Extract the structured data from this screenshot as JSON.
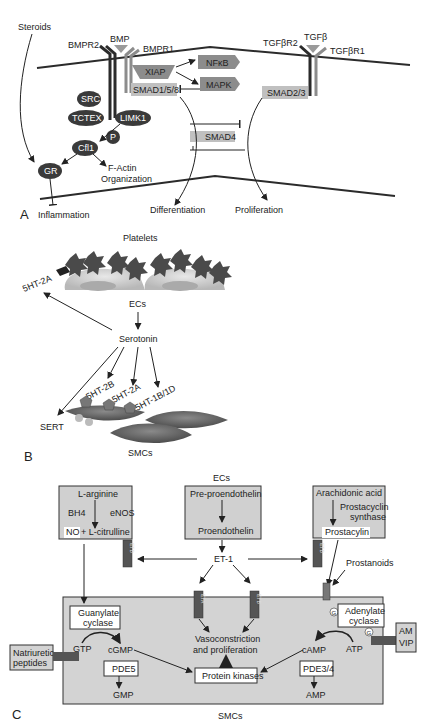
{
  "colors": {
    "membrane": "#2b2b2b",
    "dark_node": "#3a3a3a",
    "mid_gray": "#8c8c8c",
    "light_gray_box": "#c9c9c9",
    "panel_c_box": "#d6d6d6",
    "receptor_dark": "#555555",
    "text": "#222222"
  },
  "panelA": {
    "label": "A",
    "steroids": "Steroids",
    "bmp": "BMP",
    "bmpr2": "BMPR2",
    "bmpr1": "BMPR1",
    "xiap": "XIAP",
    "nfkb": "NFκB",
    "mapk": "MAPK",
    "smad158": "SMAD1/5/8",
    "tgfb": "TGFβ",
    "tgfbr2": "TGFβR2",
    "tgfbr1": "TGFβR1",
    "smad23": "SMAD2/3",
    "smad4": "SMAD4",
    "src": "SRC",
    "tctex": "TCTEX",
    "limk1": "LIMK1",
    "p": "P",
    "cfl1": "Cfl1",
    "gr": "GR",
    "factin1": "F-Actin",
    "factin2": "Organization",
    "inflammation": "Inflammation",
    "differentiation": "Differentiation",
    "proliferation": "Proliferation"
  },
  "panelB": {
    "label": "B",
    "platelets": "Platelets",
    "ht2a_top": "5HT-2A",
    "ecs": "ECs",
    "serotonin": "Serotonin",
    "ht2b": "5HT-2B",
    "ht2a": "5HT-2A",
    "ht1b1d": "5HT-1B/1D",
    "sert": "SERT",
    "smcs": "SMCs"
  },
  "panelC": {
    "label": "C",
    "ecs": "ECs",
    "smcs": "SMCs",
    "larginine": "L-arginine",
    "bh4": "BH4",
    "enos": "eNOS",
    "no": "NO",
    "lcitrulline": "+ L-citrulline",
    "preproendothelin": "Pre-proendothelin",
    "proendothelin": "Proendothelin",
    "et1": "ET-1",
    "arachidonic": "Arachidonic acid",
    "prostacyclin_synthase1": "Prostacyclin",
    "prostacyclin_synthase2": "synthase",
    "prostacyclin": "Prostacylin",
    "prostanoids": "Prostanoids",
    "etb": "ETB",
    "eta": "ETA",
    "guanylate1": "Guanylate",
    "guanylate2": "cyclase",
    "adenylate1": "Adenylate",
    "adenylate2": "cyclase",
    "natriuretic1": "Natriuretic",
    "natriuretic2": "peptides",
    "gtp": "GTP",
    "cgmp": "cGMP",
    "pde5": "PDE5",
    "gmp": "GMP",
    "vaso1": "Vasoconstriction",
    "vaso2": "and proliferation",
    "protein_kinases": "Protein kinases",
    "camp": "cAMP",
    "atp": "ATP",
    "pde34": "PDE3/4",
    "amp": "AMP",
    "g": "G",
    "am": "AM",
    "vip": "VIP"
  }
}
